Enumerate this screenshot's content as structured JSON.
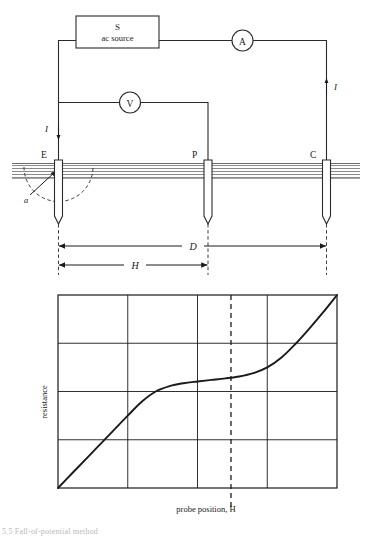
{
  "figure": {
    "caption": "5.5  Fall-of-potential method",
    "circuit": {
      "source_box": {
        "line1": "S",
        "line2": "ac source"
      },
      "ammeter": {
        "label": "A"
      },
      "voltmeter": {
        "label": "V"
      },
      "electrodes": [
        {
          "id": "E",
          "label": "E",
          "name": "earth-electrode"
        },
        {
          "id": "P",
          "label": "P",
          "name": "potential-probe"
        },
        {
          "id": "C",
          "label": "C",
          "name": "current-electrode"
        }
      ],
      "current_labels": [
        {
          "label": "I",
          "name": "current-arrow-left"
        },
        {
          "label": "I",
          "name": "current-arrow-right"
        }
      ],
      "hemisphere_label": "a",
      "dimensions": [
        {
          "label": "D",
          "from": "E",
          "to": "C"
        },
        {
          "label": "H",
          "from": "E",
          "to": "P"
        }
      ]
    }
  },
  "chart_data": {
    "type": "line",
    "title": "",
    "xlabel": "probe position, H",
    "ylabel": "resistance",
    "xlim": [
      0,
      1
    ],
    "ylim": [
      0,
      1
    ],
    "grid": true,
    "xticks": [],
    "yticks": [],
    "x_gridlines": [
      0.25,
      0.5,
      0.75
    ],
    "y_gridlines": [
      0.25,
      0.5,
      0.75
    ],
    "annotations": [
      {
        "type": "vline",
        "x": 0.62,
        "style": "dashed",
        "label": "probe position, H"
      }
    ],
    "series": [
      {
        "name": "resistance vs probe position",
        "x": [
          0.0,
          0.05,
          0.1,
          0.15,
          0.2,
          0.25,
          0.3,
          0.35,
          0.4,
          0.45,
          0.5,
          0.55,
          0.6,
          0.65,
          0.7,
          0.75,
          0.8,
          0.85,
          0.9,
          0.95,
          1.0
        ],
        "y": [
          0.0,
          0.075,
          0.15,
          0.225,
          0.3,
          0.375,
          0.447,
          0.5,
          0.528,
          0.543,
          0.552,
          0.56,
          0.568,
          0.578,
          0.595,
          0.625,
          0.675,
          0.745,
          0.825,
          0.91,
          1.0
        ]
      }
    ]
  }
}
